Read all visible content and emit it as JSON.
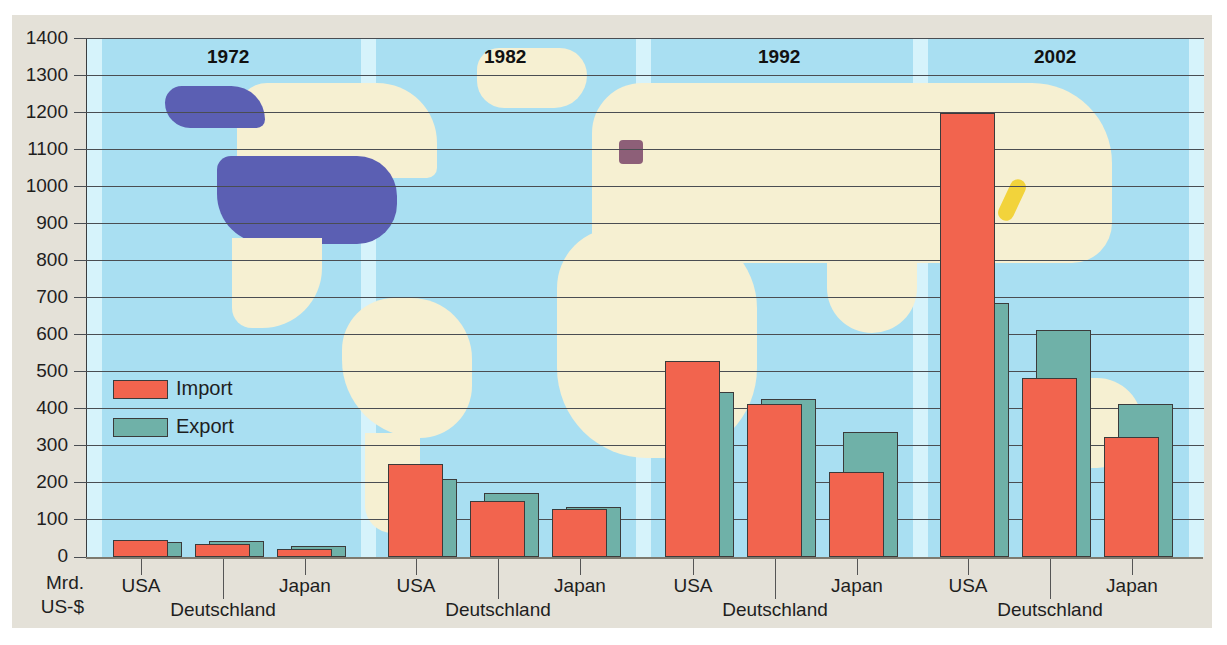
{
  "chart_data": {
    "type": "bar",
    "title": "",
    "xlabel": "",
    "ylabel": "Mrd. US-$",
    "ylim": [
      0,
      1400
    ],
    "yticks": [
      0,
      100,
      200,
      300,
      400,
      500,
      600,
      700,
      800,
      900,
      1000,
      1100,
      1200,
      1300,
      1400
    ],
    "grid": true,
    "legend_position": "left-middle inside plot",
    "background": "world map with USA, Deutschland, Japan highlighted",
    "groups": [
      "1972",
      "1982",
      "1992",
      "2002"
    ],
    "categories": [
      "USA",
      "Deutschland",
      "Japan"
    ],
    "series": [
      {
        "name": "Import",
        "color": "#f2644e",
        "values": {
          "1972": [
            46,
            35,
            22
          ],
          "1982": [
            251,
            151,
            129
          ],
          "1992": [
            528,
            413,
            229
          ],
          "2002": [
            1198,
            483,
            324
          ]
        }
      },
      {
        "name": "Export",
        "color": "#6fb1a8",
        "values": {
          "1972": [
            40,
            43,
            29
          ],
          "1982": [
            210,
            173,
            135
          ],
          "1992": [
            445,
            426,
            337
          ],
          "2002": [
            686,
            612,
            413
          ]
        }
      }
    ]
  },
  "axis": {
    "unit_line1": "Mrd.",
    "unit_line2": "US-$",
    "ticks": [
      "1400",
      "1300",
      "1200",
      "1100",
      "1000",
      "900",
      "800",
      "700",
      "600",
      "500",
      "400",
      "300",
      "200",
      "100",
      "0"
    ]
  },
  "years": [
    "1972",
    "1982",
    "1992",
    "2002"
  ],
  "countries": [
    "USA",
    "Deutschland",
    "Japan"
  ],
  "legend": {
    "import_label": "Import",
    "export_label": "Export"
  },
  "colors": {
    "import": "#f2644e",
    "export": "#6fb1a8",
    "ocean": "#a9dff2",
    "land": "#f6f0d2",
    "usa_highlight": "#5b5fb3",
    "germany_highlight": "#8d5f78",
    "japan_highlight": "#f2d33b"
  }
}
